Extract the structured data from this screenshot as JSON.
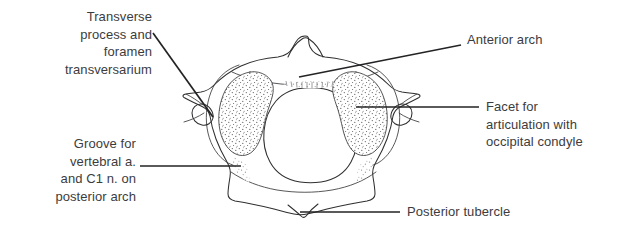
{
  "figure": {
    "background_color": "#ffffff",
    "text_color": "#3c3c3e",
    "line_color": "#2f2f31",
    "width": 629,
    "height": 235
  },
  "labels": {
    "transverse_process": "Transverse\nprocess and\nforamen\ntransversarium",
    "groove_vertebral": "Groove for\nvertebral a.\nand C1 n. on\nposterior arch",
    "anterior_arch": "Anterior arch",
    "facet_occipital": "Facet for\narticulation with\noccipital condyle",
    "posterior_tubercle": "Posterior tubercle"
  },
  "structures": [
    {
      "name": "transverse-process-and-foramen-transversarium",
      "side": "left"
    },
    {
      "name": "groove-for-vertebral-artery-and-c1-nerve",
      "side": "left"
    },
    {
      "name": "anterior-arch",
      "side": "right"
    },
    {
      "name": "facet-for-articulation-with-occipital-condyle",
      "side": "right"
    },
    {
      "name": "posterior-tubercle",
      "side": "right"
    },
    {
      "name": "anterior-tubercle",
      "side": "center"
    },
    {
      "name": "vertebral-foramen",
      "side": "center"
    },
    {
      "name": "superior-articular-facet-left",
      "side": "left"
    },
    {
      "name": "superior-articular-facet-right",
      "side": "right"
    }
  ]
}
